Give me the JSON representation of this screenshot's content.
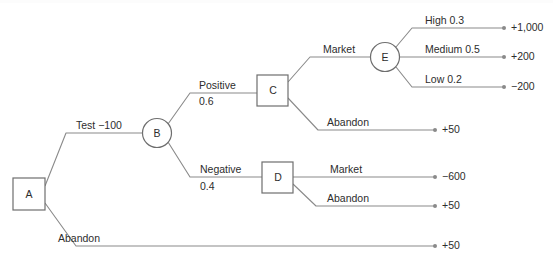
{
  "diagram": {
    "type": "decision-tree",
    "nodes": [
      {
        "id": "A",
        "label": "A",
        "shape": "square",
        "role": "decision",
        "x": 29,
        "y": 194
      },
      {
        "id": "B",
        "label": "B",
        "shape": "circle",
        "role": "chance",
        "x": 157,
        "y": 133
      },
      {
        "id": "C",
        "label": "C",
        "shape": "square",
        "role": "decision",
        "x": 272,
        "y": 90
      },
      {
        "id": "D",
        "label": "D",
        "shape": "square",
        "role": "decision",
        "x": 277,
        "y": 177
      },
      {
        "id": "E",
        "label": "E",
        "shape": "circle",
        "role": "chance",
        "x": 385,
        "y": 57
      }
    ],
    "branches": [
      {
        "id": "a-test",
        "from": "A",
        "to": "B",
        "label": "Test  −100",
        "probability": "",
        "outcome": ""
      },
      {
        "id": "a-abandon",
        "from": "A",
        "to": "end",
        "label": "Abandon",
        "probability": "",
        "outcome": "+50"
      },
      {
        "id": "b-positive",
        "from": "B",
        "to": "C",
        "label": "Positive",
        "probability": "0.6",
        "outcome": ""
      },
      {
        "id": "b-negative",
        "from": "B",
        "to": "D",
        "label": "Negative",
        "probability": "0.4",
        "outcome": ""
      },
      {
        "id": "c-market",
        "from": "C",
        "to": "E",
        "label": "Market",
        "probability": "",
        "outcome": ""
      },
      {
        "id": "c-abandon",
        "from": "C",
        "to": "end",
        "label": "Abandon",
        "probability": "",
        "outcome": "+50"
      },
      {
        "id": "d-market",
        "from": "D",
        "to": "end",
        "label": "Market",
        "probability": "",
        "outcome": "−600"
      },
      {
        "id": "d-abandon",
        "from": "D",
        "to": "end",
        "label": "Abandon",
        "probability": "",
        "outcome": "+50"
      },
      {
        "id": "e-high",
        "from": "E",
        "to": "end",
        "label": "High 0.3",
        "probability": "0.3",
        "outcome": "+1,000"
      },
      {
        "id": "e-medium",
        "from": "E",
        "to": "end",
        "label": "Medium 0.5",
        "probability": "0.5",
        "outcome": "+200"
      },
      {
        "id": "e-low",
        "from": "E",
        "to": "end",
        "label": "Low 0.2",
        "probability": "0.2",
        "outcome": "−200"
      }
    ],
    "labels": {
      "test": "Test  −100",
      "positive": "Positive",
      "positive_prob": "0.6",
      "negative": "Negative",
      "negative_prob": "0.4",
      "market_c": "Market",
      "abandon_c": "Abandon",
      "market_d": "Market",
      "abandon_d": "Abandon",
      "abandon_a": "Abandon",
      "high": "High 0.3",
      "medium": "Medium 0.5",
      "low": "Low 0.2"
    },
    "outcomes": {
      "high": "+1,000",
      "medium": "+200",
      "low": "−200",
      "abandon_c": "+50",
      "market_d": "−600",
      "abandon_d": "+50",
      "abandon_a": "+50"
    },
    "colors": {
      "line": "#8a8a8a",
      "node_stroke": "#6e6e6e",
      "text": "#2d2d2d",
      "background": "#ffffff"
    }
  }
}
